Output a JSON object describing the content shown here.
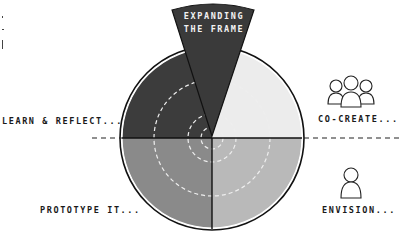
{
  "diagram": {
    "wedge_label_line1": "EXPANDING",
    "wedge_label_line2": "THE FRAME",
    "quadrants": [
      {
        "position": "top-left",
        "label": "LEARN & REFLECT...",
        "color": "#3c3c3c"
      },
      {
        "position": "top-right",
        "label": "CO-CREATE...",
        "color": "#ececec",
        "icon": "group-of-people-icon"
      },
      {
        "position": "bottom-left",
        "label": "PROTOTYPE IT...",
        "color": "#8a8a8a"
      },
      {
        "position": "bottom-right",
        "label": "ENVISION...",
        "color": "#b9b9b9",
        "icon": "single-person-icon"
      }
    ],
    "wedge_color": "#3a3a3a",
    "line_color": "#111111",
    "dashed_ring_color": "#eeeeee"
  }
}
